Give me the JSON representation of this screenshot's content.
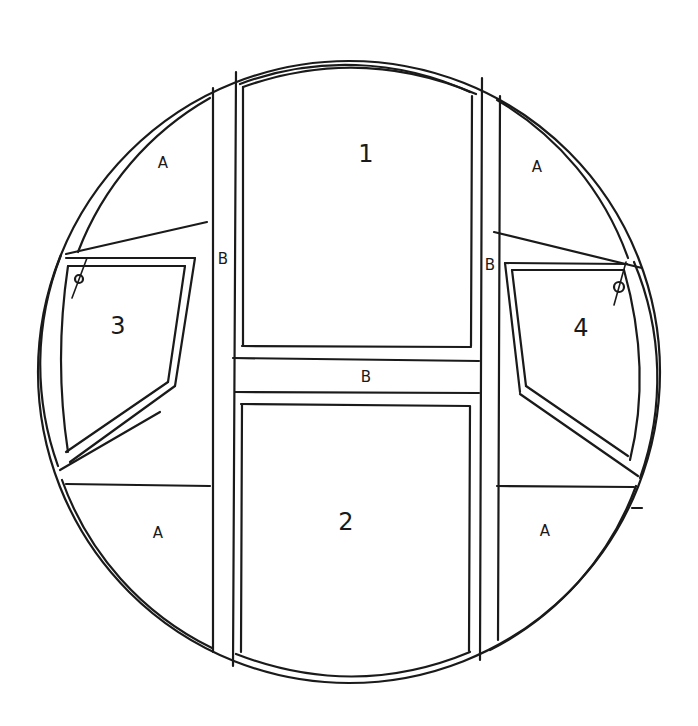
{
  "diagram": {
    "type": "hand-drawn frame sketch",
    "outline": "circular frame with double border",
    "colors": {
      "ink": "#1a1a1a",
      "paper": "#ffffff"
    }
  },
  "labels": {
    "panel_1": "1",
    "panel_2": "2",
    "panel_3": "3",
    "panel_4": "4",
    "stile_left": "B",
    "stile_right": "B",
    "rail_middle": "B",
    "corner_top_left": "A",
    "corner_top_right": "A",
    "corner_bottom_left": "A",
    "corner_bottom_right": "A"
  },
  "legend": {
    "A": "corner fill panels",
    "B": "structural members (stiles and middle rail)",
    "1": "upper center panel",
    "2": "lower center panel",
    "3": "left side window (hinged, top-left pivot)",
    "4": "right side window (hinged, top-right pivot)"
  }
}
